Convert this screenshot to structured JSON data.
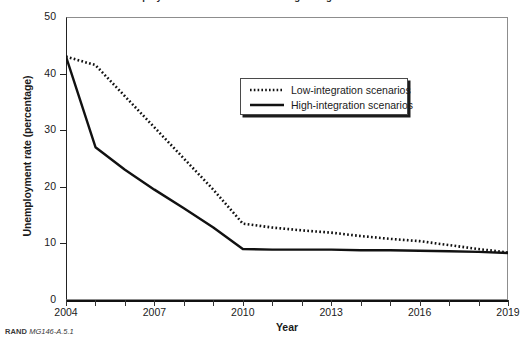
{
  "figure": {
    "title_clipped": "Unemployment Rate Under Low- and High-Integration Scenarios",
    "footer_source": "RAND",
    "footer_id": "MG146-A.5.1"
  },
  "legend": {
    "position": "inside-top-right",
    "entries": [
      {
        "label": "Low-integration scenarios",
        "style": "dotted",
        "key_icon": "dotted-line-key"
      },
      {
        "label": "High-integration scenarios",
        "style": "solid",
        "key_icon": "solid-line-key"
      }
    ]
  },
  "chart_data": {
    "type": "line",
    "title": "Unemployment Rate Under Low- and High-Integration Scenarios",
    "xlabel": "Year",
    "ylabel": "Unemployment rate (percentage)",
    "xlim": [
      2004,
      2019
    ],
    "ylim": [
      0,
      50
    ],
    "grid": false,
    "legend_position": "inside-top-right",
    "x": [
      2004,
      2005,
      2006,
      2007,
      2008,
      2009,
      2010,
      2011,
      2012,
      2013,
      2014,
      2015,
      2016,
      2017,
      2018,
      2019
    ],
    "xticks": [
      2004,
      2007,
      2010,
      2013,
      2016,
      2019
    ],
    "xticklabels": [
      "2004",
      "2007",
      "2010",
      "2013",
      "2016",
      "2019"
    ],
    "yticks": [
      0,
      10,
      20,
      30,
      40,
      50
    ],
    "yticklabels": [
      "0",
      "10",
      "20",
      "30",
      "40",
      "50"
    ],
    "series": [
      {
        "name": "Low-integration scenarios",
        "style": "dotted",
        "color": "#111111",
        "values": [
          43.0,
          41.5,
          36.0,
          30.5,
          25.0,
          19.5,
          13.5,
          12.8,
          12.3,
          11.9,
          11.3,
          10.8,
          10.4,
          9.7,
          9.0,
          8.4
        ]
      },
      {
        "name": "High-integration scenarios",
        "style": "solid",
        "color": "#111111",
        "values": [
          43.0,
          27.0,
          23.0,
          19.5,
          16.2,
          12.8,
          9.0,
          8.9,
          8.9,
          8.9,
          8.8,
          8.8,
          8.7,
          8.6,
          8.5,
          8.3
        ]
      }
    ]
  }
}
